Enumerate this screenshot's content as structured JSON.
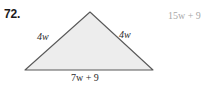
{
  "problem": {
    "number_label": "72."
  },
  "figure": {
    "shape_name": "isosceles-triangle",
    "fill_color": "#ededed",
    "stroke_color": "#595959",
    "vertices": {
      "apex": [
        90,
        12
      ],
      "base_left": [
        25,
        70
      ],
      "base_right": [
        153,
        70
      ]
    },
    "labels": {
      "side_left": "4w",
      "side_right": "4w",
      "base": "7w + 9"
    }
  },
  "answer": {
    "text": "15w + 9",
    "color": "#a8a8a8"
  }
}
